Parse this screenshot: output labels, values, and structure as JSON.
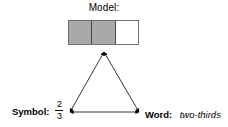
{
  "diagram": {
    "model": {
      "label": "Model:",
      "cells": [
        {
          "shaded": true
        },
        {
          "shaded": true
        },
        {
          "shaded": false
        }
      ],
      "shaded_count": 2,
      "total_count": 3,
      "shaded_color": "#a9a9a9",
      "unshaded_color": "#ffffff",
      "border_color": "#6f6f6f"
    },
    "symbol": {
      "label": "Symbol:",
      "numerator": "2",
      "denominator": "3"
    },
    "word": {
      "label": "Word:",
      "value": "two-thirds"
    },
    "connector": {
      "type": "triangle",
      "stroke_color": "#000000",
      "arrowheads": "double",
      "vertices": {
        "apex": {
          "x": 104,
          "y": 52
        },
        "bottom_left": {
          "x": 70,
          "y": 112
        },
        "bottom_right": {
          "x": 139,
          "y": 112
        }
      }
    }
  }
}
